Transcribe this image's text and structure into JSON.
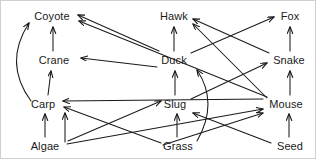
{
  "diagram": {
    "type": "food-web-diagram",
    "background_color": "#ffffff",
    "line_color": "#1a1a1a",
    "text_color": "#1a1a1a",
    "nodes": [
      {
        "id": "coyote",
        "label": "Coyote",
        "x": 51,
        "y": 15,
        "w": 40
      },
      {
        "id": "hawk",
        "label": "Hawk",
        "x": 173,
        "y": 15,
        "w": 32
      },
      {
        "id": "fox",
        "label": "Fox",
        "x": 289,
        "y": 15,
        "w": 22
      },
      {
        "id": "crane",
        "label": "Crane",
        "x": 53,
        "y": 59,
        "w": 36
      },
      {
        "id": "duck",
        "label": "Duck",
        "x": 173,
        "y": 59,
        "w": 31
      },
      {
        "id": "snake",
        "label": "Snake",
        "x": 288,
        "y": 59,
        "w": 36
      },
      {
        "id": "carp",
        "label": "Carp",
        "x": 42,
        "y": 103,
        "w": 28
      },
      {
        "id": "slug",
        "label": "Slug",
        "x": 174,
        "y": 103,
        "w": 26
      },
      {
        "id": "mouse",
        "label": "Mouse",
        "x": 285,
        "y": 103,
        "w": 39
      },
      {
        "id": "algae",
        "label": "Algae",
        "x": 44,
        "y": 145,
        "w": 33
      },
      {
        "id": "grass",
        "label": "Grass",
        "x": 177,
        "y": 145,
        "w": 34
      },
      {
        "id": "seed",
        "label": "Seed",
        "x": 289,
        "y": 145,
        "w": 28
      }
    ],
    "edges": [
      {
        "id": "algae-carp",
        "from": "Algae",
        "to": "Carp",
        "kind": "straight",
        "x1": 44,
        "y1": 136,
        "x2": 44,
        "y2": 113
      },
      {
        "id": "carp-crane",
        "from": "Carp",
        "to": "Crane",
        "kind": "straight",
        "x1": 47,
        "y1": 94,
        "x2": 50,
        "y2": 70
      },
      {
        "id": "crane-coyote",
        "from": "Crane",
        "to": "Coyote",
        "kind": "straight",
        "x1": 52,
        "y1": 50,
        "x2": 52,
        "y2": 26
      },
      {
        "id": "carp-coyote",
        "from": "Carp",
        "to": "Coyote",
        "kind": "curve",
        "x1": 30,
        "y1": 100,
        "cx": 2,
        "cy": 62,
        "x2": 28,
        "y2": 22
      },
      {
        "id": "grass-slug",
        "from": "Grass",
        "to": "Slug",
        "kind": "straight",
        "x1": 176,
        "y1": 136,
        "x2": 176,
        "y2": 113
      },
      {
        "id": "slug-duck",
        "from": "Slug",
        "to": "Duck",
        "kind": "straight",
        "x1": 174,
        "y1": 94,
        "x2": 174,
        "y2": 70
      },
      {
        "id": "duck-hawk",
        "from": "Duck",
        "to": "Hawk",
        "kind": "straight",
        "x1": 173,
        "y1": 50,
        "x2": 173,
        "y2": 26
      },
      {
        "id": "grass-duck",
        "from": "Grass",
        "to": "Duck",
        "kind": "curve",
        "x1": 196,
        "y1": 140,
        "cx": 218,
        "cy": 102,
        "x2": 196,
        "y2": 69
      },
      {
        "id": "seed-mouse",
        "from": "Seed",
        "to": "Mouse",
        "kind": "straight",
        "x1": 288,
        "y1": 136,
        "x2": 288,
        "y2": 113
      },
      {
        "id": "mouse-snake",
        "from": "Mouse",
        "to": "Snake",
        "kind": "straight",
        "x1": 289,
        "y1": 94,
        "x2": 289,
        "y2": 70
      },
      {
        "id": "snake-fox",
        "from": "Snake",
        "to": "Fox",
        "kind": "straight",
        "x1": 289,
        "y1": 50,
        "x2": 289,
        "y2": 26
      },
      {
        "id": "duck-coyote",
        "from": "Duck",
        "to": "Coyote",
        "kind": "straight",
        "x1": 158,
        "y1": 50,
        "x2": 77,
        "y2": 14
      },
      {
        "id": "mouse-coyote",
        "from": "Mouse",
        "to": "Coyote",
        "kind": "straight",
        "x1": 266,
        "y1": 96,
        "x2": 78,
        "y2": 20
      },
      {
        "id": "duck-crane",
        "from": "Duck",
        "to": "Crane",
        "kind": "straight",
        "x1": 156,
        "y1": 66,
        "x2": 80,
        "y2": 57
      },
      {
        "id": "mouse-hawk",
        "from": "Mouse",
        "to": "Hawk",
        "kind": "straight",
        "x1": 266,
        "y1": 97,
        "x2": 192,
        "y2": 23
      },
      {
        "id": "snake-hawk",
        "from": "Snake",
        "to": "Hawk",
        "kind": "straight",
        "x1": 268,
        "y1": 52,
        "x2": 192,
        "y2": 18
      },
      {
        "id": "duck-fox",
        "from": "Duck",
        "to": "Fox",
        "kind": "straight",
        "x1": 190,
        "y1": 52,
        "x2": 273,
        "y2": 16
      },
      {
        "id": "slug-snake",
        "from": "Slug",
        "to": "Snake",
        "kind": "straight",
        "x1": 190,
        "y1": 98,
        "x2": 266,
        "y2": 62
      },
      {
        "id": "grass-carp",
        "from": "Grass",
        "to": "Carp",
        "kind": "straight",
        "x1": 160,
        "y1": 142,
        "x2": 63,
        "y2": 106
      },
      {
        "id": "algae-carp2",
        "from": "Algae",
        "to": "Carp",
        "kind": "straight",
        "x1": 64,
        "y1": 141,
        "x2": 64,
        "y2": 112
      },
      {
        "id": "mouse-carp",
        "from": "Mouse",
        "to": "Carp",
        "kind": "straight",
        "x1": 262,
        "y1": 98,
        "x2": 62,
        "y2": 100
      },
      {
        "id": "algae-mouse",
        "from": "Algae",
        "to": "Mouse",
        "kind": "straight",
        "x1": 66,
        "y1": 143,
        "x2": 262,
        "y2": 108
      },
      {
        "id": "grass-mouse",
        "from": "Grass",
        "to": "Mouse",
        "kind": "straight",
        "x1": 162,
        "y1": 144,
        "x2": 262,
        "y2": 112
      },
      {
        "id": "seed-slug",
        "from": "Seed",
        "to": "Slug",
        "kind": "straight",
        "x1": 270,
        "y1": 142,
        "x2": 192,
        "y2": 112
      },
      {
        "id": "algae-slug",
        "from": "Algae",
        "to": "Slug",
        "kind": "straight",
        "x1": 67,
        "y1": 140,
        "x2": 160,
        "y2": 100
      }
    ]
  }
}
